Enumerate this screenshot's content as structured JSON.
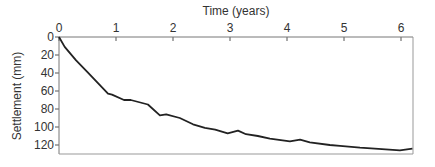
{
  "chart_data": {
    "type": "line",
    "title": "",
    "xlabel": "Time (years)",
    "ylabel": "Settlement (mm)",
    "xlim": [
      0,
      6.25
    ],
    "ylim": [
      0,
      130
    ],
    "y_inverted": true,
    "x_axis_position": "top",
    "x_ticks": [
      0,
      1,
      2,
      3,
      4,
      5,
      6
    ],
    "x_tick_labels": [
      "0",
      "1",
      "2",
      "3",
      "4",
      "5",
      "6"
    ],
    "y_ticks": [
      0,
      20,
      40,
      60,
      80,
      100,
      120
    ],
    "y_tick_labels": [
      "0",
      "20",
      "40",
      "60",
      "80",
      "100",
      "120"
    ],
    "grid": false,
    "legend": "none",
    "line_color": "#222222",
    "series": [
      {
        "name": "Settlement",
        "x": [
          0,
          0.1,
          0.3,
          0.5,
          0.86,
          0.93,
          1.14,
          1.26,
          1.56,
          1.77,
          1.88,
          2.12,
          2.35,
          2.56,
          2.74,
          2.96,
          3.14,
          3.28,
          3.49,
          3.7,
          4.05,
          4.23,
          4.4,
          4.75,
          4.93,
          5.28,
          5.54,
          5.98,
          6.2
        ],
        "y": [
          0,
          11,
          26,
          39,
          63,
          64,
          70,
          70,
          75,
          87,
          86,
          90,
          97,
          101,
          103,
          107,
          104,
          108,
          110,
          113,
          116,
          114,
          117,
          120,
          121,
          123,
          124,
          126,
          124
        ]
      }
    ]
  }
}
